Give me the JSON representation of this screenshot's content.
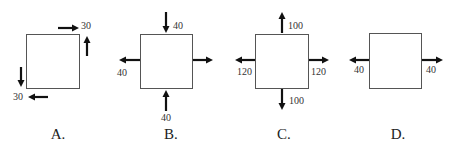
{
  "diagrams": [
    {
      "id": "A",
      "caption": "A.",
      "forces": [
        {
          "position": "top-right",
          "direction": "right",
          "value": "30"
        },
        {
          "position": "right-upper",
          "direction": "up",
          "value": ""
        },
        {
          "position": "left-lower",
          "direction": "down",
          "value": ""
        },
        {
          "position": "bottom-left",
          "direction": "left",
          "value": "30"
        }
      ],
      "labels": {
        "top": "30",
        "bottom": "30"
      }
    },
    {
      "id": "B",
      "caption": "B.",
      "forces": [
        {
          "position": "top",
          "direction": "down",
          "value": "40"
        },
        {
          "position": "left",
          "direction": "left",
          "value": "40"
        },
        {
          "position": "right",
          "direction": "right",
          "value": ""
        },
        {
          "position": "bottom",
          "direction": "up",
          "value": "40"
        }
      ],
      "labels": {
        "top": "40",
        "left": "40",
        "bottom": "40"
      }
    },
    {
      "id": "C",
      "caption": "C.",
      "forces": [
        {
          "position": "top",
          "direction": "up",
          "value": "100"
        },
        {
          "position": "left",
          "direction": "left",
          "value": "120"
        },
        {
          "position": "right",
          "direction": "right",
          "value": "120"
        },
        {
          "position": "bottom",
          "direction": "down",
          "value": "100"
        }
      ],
      "labels": {
        "top": "100",
        "left": "120",
        "right": "120",
        "bottom": "100"
      }
    },
    {
      "id": "D",
      "caption": "D.",
      "forces": [
        {
          "position": "left",
          "direction": "left",
          "value": "40"
        },
        {
          "position": "right",
          "direction": "right",
          "value": "40"
        }
      ],
      "labels": {
        "left": "40",
        "right": "40"
      }
    }
  ]
}
